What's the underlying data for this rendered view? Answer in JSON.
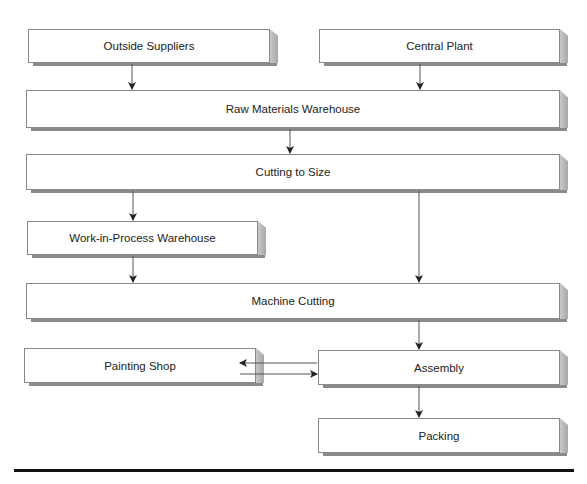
{
  "nodes": {
    "outside_suppliers": "Outside Suppliers",
    "central_plant": "Central Plant",
    "raw_materials": "Raw Materials Warehouse",
    "cutting_to_size": "Cutting to Size",
    "wip_warehouse": "Work-in-Process Warehouse",
    "machine_cutting": "Machine Cutting",
    "painting_shop": "Painting Shop",
    "assembly": "Assembly",
    "packing": "Packing"
  },
  "edges": [
    [
      "Outside Suppliers",
      "Raw Materials Warehouse"
    ],
    [
      "Central Plant",
      "Raw Materials Warehouse"
    ],
    [
      "Raw Materials Warehouse",
      "Cutting to Size"
    ],
    [
      "Cutting to Size",
      "Work-in-Process Warehouse"
    ],
    [
      "Cutting to Size",
      "Machine Cutting"
    ],
    [
      "Work-in-Process Warehouse",
      "Machine Cutting"
    ],
    [
      "Machine Cutting",
      "Assembly"
    ],
    [
      "Assembly",
      "Painting Shop"
    ],
    [
      "Painting Shop",
      "Assembly"
    ],
    [
      "Assembly",
      "Packing"
    ]
  ]
}
